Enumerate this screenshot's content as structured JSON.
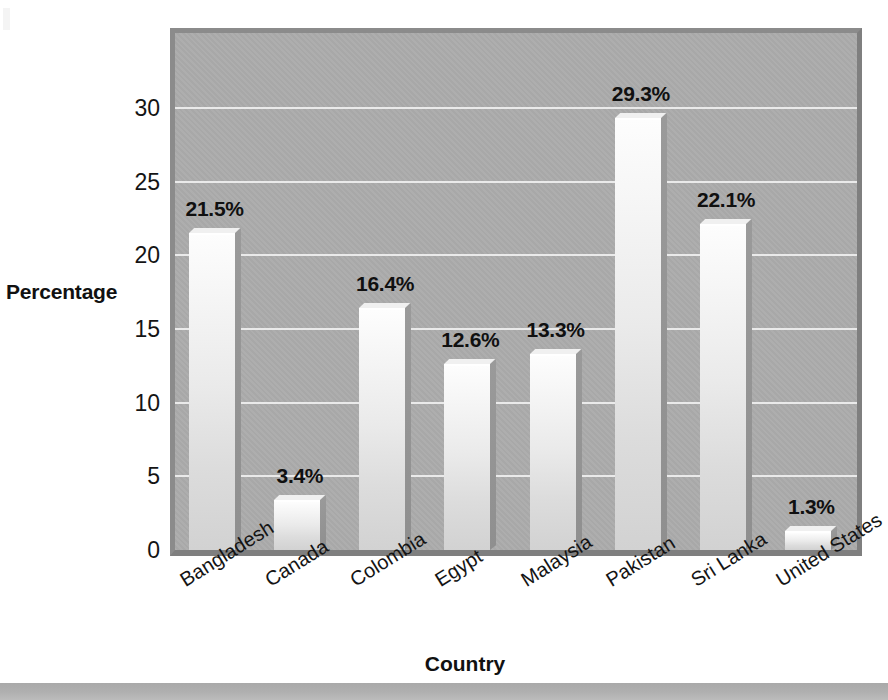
{
  "chart_data": {
    "type": "bar",
    "title": "",
    "xlabel": "Country",
    "ylabel": "Percentage",
    "categories": [
      "Bangladesh",
      "Canada",
      "Colombia",
      "Egypt",
      "Malaysia",
      "Pakistan",
      "Sri Lanka",
      "United States"
    ],
    "values": [
      21.5,
      3.4,
      16.4,
      12.6,
      13.3,
      29.3,
      22.1,
      1.3
    ],
    "data_labels": [
      "21.5%",
      "3.4%",
      "16.4%",
      "12.6%",
      "13.3%",
      "29.3%",
      "22.1%",
      "1.3%"
    ],
    "ytick_labels": [
      "0",
      "5",
      "10",
      "15",
      "20",
      "25",
      "30"
    ],
    "ytick_values": [
      0,
      5,
      10,
      15,
      20,
      25,
      30
    ],
    "ylim": [
      0,
      35.1
    ],
    "grid": "horizontal",
    "legend": "none",
    "colors": {
      "plot_background": "#ababab",
      "bar_fill_top": "#fdfdfd",
      "bar_fill_bottom": "#d2d2d2",
      "bar_shadow": "#8f8f8f",
      "gridline": "#ededed",
      "frame": "#8b8b8b",
      "text": "#101010",
      "page_background": "#ffffff"
    }
  }
}
